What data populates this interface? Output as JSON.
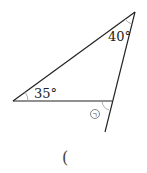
{
  "diagram": {
    "type": "triangle-exterior-angle",
    "angles": {
      "top": "40°",
      "left": "35°",
      "exterior_marker": "㉠"
    },
    "answer_blank": "("
  }
}
